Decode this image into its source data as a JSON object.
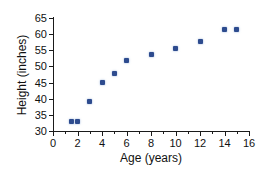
{
  "chart_data": {
    "type": "scatter",
    "title": "",
    "xlabel": "Age (years)",
    "ylabel": "Height (inches)",
    "xlim": [
      0,
      16
    ],
    "ylim": [
      30,
      65
    ],
    "grid": false,
    "legend": null,
    "x_ticks": [
      0,
      2,
      4,
      6,
      8,
      10,
      12,
      14,
      16
    ],
    "x_minor_ticks": [
      1,
      3,
      5,
      7,
      9,
      11,
      13,
      15
    ],
    "y_ticks": [
      30,
      35,
      40,
      45,
      50,
      55,
      60,
      65
    ],
    "x_tick_labels": [
      "0",
      "2",
      "4",
      "6",
      "8",
      "10",
      "12",
      "14",
      "16"
    ],
    "y_tick_labels": [
      "30",
      "35",
      "40",
      "45",
      "50",
      "55",
      "60",
      "65"
    ],
    "marker_color": "#2d4b8e",
    "axis_color": "#1a1a1a",
    "points": [
      {
        "x": 1.5,
        "y": 33
      },
      {
        "x": 2,
        "y": 33
      },
      {
        "x": 3,
        "y": 39
      },
      {
        "x": 4,
        "y": 45
      },
      {
        "x": 5,
        "y": 47.8
      },
      {
        "x": 6,
        "y": 51.7
      },
      {
        "x": 8,
        "y": 53.7
      },
      {
        "x": 10,
        "y": 55.5
      },
      {
        "x": 12,
        "y": 57.7
      },
      {
        "x": 14,
        "y": 61.5
      },
      {
        "x": 15,
        "y": 61.5
      }
    ]
  }
}
